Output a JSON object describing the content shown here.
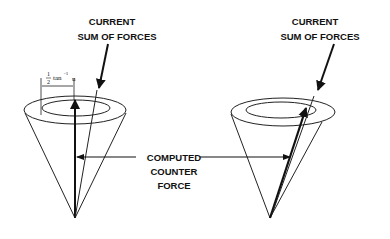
{
  "diagram": {
    "left_cone": {
      "label_line1": "CURRENT",
      "label_line2": "SUM OF FORCES",
      "dimension_label": {
        "fraction_numerator": "1",
        "fraction_denominator": "2",
        "function": "tan",
        "exponent": "-1",
        "argument": "u"
      }
    },
    "right_cone": {
      "label_line1": "CURRENT",
      "label_line2": "SUM OF FORCES"
    },
    "center_label": {
      "line1": "COMPUTED",
      "line2": "COUNTER",
      "line3": "FORCE"
    },
    "colors": {
      "ink": "#111111",
      "background": "#ffffff"
    }
  }
}
